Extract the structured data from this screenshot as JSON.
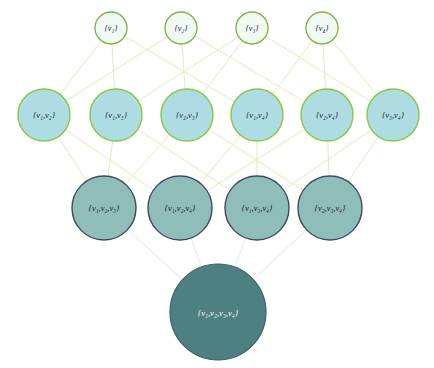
{
  "diagram": {
    "canvas": {
      "width": 434,
      "height": 368,
      "background": "#ffffff"
    },
    "colors": {
      "row1_fill": "#f2f9f4",
      "row1_stroke": "#7cb342",
      "row2_fill": "#addde2",
      "row2_stroke": "#8cc63f",
      "row3_fill": "#8fbdb8",
      "row3_stroke": "#3d4a63",
      "row4_fill": "#4d8080",
      "row4_stroke": "#3d5f66",
      "edge_upper": "#dfe6b4",
      "edge_lower": "#e9ecef",
      "label_dark": "#1b1b2b",
      "label_light": "#ffffff"
    },
    "levels": [
      {
        "name": "singletons",
        "cy": 28,
        "r": 16,
        "nodes": [
          {
            "id": "v1",
            "label": "{v₁}",
            "cx": 111
          },
          {
            "id": "v2",
            "label": "{v₂}",
            "cx": 181
          },
          {
            "id": "v3",
            "label": "{v₃}",
            "cx": 252
          },
          {
            "id": "v4",
            "label": "{v₄}",
            "cx": 322
          }
        ]
      },
      {
        "name": "pairs",
        "cy": 115,
        "r": 26,
        "nodes": [
          {
            "id": "v1v2",
            "label": "{v₁,v₂}",
            "cx": 44
          },
          {
            "id": "v1v3",
            "label": "{v₁,v₃}",
            "cx": 116
          },
          {
            "id": "v2v3",
            "label": "{v₂,v₃}",
            "cx": 187
          },
          {
            "id": "v1v4",
            "label": "{v₁,v₄}",
            "cx": 257
          },
          {
            "id": "v2v4",
            "label": "{v₂,v₄}",
            "cx": 327
          },
          {
            "id": "v3v4",
            "label": "{v₃,v₄}",
            "cx": 393
          }
        ]
      },
      {
        "name": "triples",
        "cy": 208,
        "r": 32,
        "nodes": [
          {
            "id": "v1v2v3",
            "label": "{v₁,v₂,v₃}",
            "cx": 104
          },
          {
            "id": "v1v2v4",
            "label": "{v₁,v₂,v₄}",
            "cx": 180
          },
          {
            "id": "v1v3v4",
            "label": "{v₁,v₃,v₄}",
            "cx": 257
          },
          {
            "id": "v2v3v4",
            "label": "{v₂,v₃,v₄}",
            "cx": 330
          }
        ]
      },
      {
        "name": "full-set",
        "cy": 312,
        "r": 48,
        "nodes": [
          {
            "id": "v1v2v3v4",
            "label": "{v₁,v₂,v₃,v₄}",
            "cx": 218
          }
        ]
      }
    ],
    "edges_level1_2": [
      {
        "from": "v1",
        "to": "v1v2"
      },
      {
        "from": "v1",
        "to": "v1v3"
      },
      {
        "from": "v1",
        "to": "v1v4"
      },
      {
        "from": "v2",
        "to": "v1v2"
      },
      {
        "from": "v2",
        "to": "v2v3"
      },
      {
        "from": "v2",
        "to": "v2v4"
      },
      {
        "from": "v3",
        "to": "v1v3"
      },
      {
        "from": "v3",
        "to": "v2v3"
      },
      {
        "from": "v3",
        "to": "v3v4"
      },
      {
        "from": "v4",
        "to": "v1v4"
      },
      {
        "from": "v4",
        "to": "v2v4"
      },
      {
        "from": "v4",
        "to": "v3v4"
      }
    ],
    "edges_level2_3": [
      {
        "from": "v1v2",
        "to": "v1v2v3"
      },
      {
        "from": "v1v2",
        "to": "v1v2v4"
      },
      {
        "from": "v1v3",
        "to": "v1v2v3"
      },
      {
        "from": "v1v3",
        "to": "v1v3v4"
      },
      {
        "from": "v2v3",
        "to": "v1v2v3"
      },
      {
        "from": "v2v3",
        "to": "v2v3v4"
      },
      {
        "from": "v1v4",
        "to": "v1v2v4"
      },
      {
        "from": "v1v4",
        "to": "v1v3v4"
      },
      {
        "from": "v2v4",
        "to": "v1v2v4"
      },
      {
        "from": "v2v4",
        "to": "v2v3v4"
      },
      {
        "from": "v3v4",
        "to": "v1v3v4"
      },
      {
        "from": "v3v4",
        "to": "v2v3v4"
      }
    ],
    "edges_level3_4": [
      {
        "from": "v1v2v3",
        "to": "v1v2v3v4"
      },
      {
        "from": "v1v2v4",
        "to": "v1v2v3v4"
      },
      {
        "from": "v1v3v4",
        "to": "v1v2v3v4"
      },
      {
        "from": "v2v3v4",
        "to": "v1v2v3v4"
      }
    ]
  }
}
